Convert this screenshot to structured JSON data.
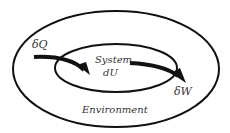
{
  "diagram": {
    "labels": {
      "heat": "δQ",
      "system": "System",
      "internal_energy": "dU",
      "work": "δW",
      "environment": "Environment"
    },
    "colors": {
      "stroke": "#111111",
      "text": "#333333",
      "background": "#ffffff"
    }
  }
}
